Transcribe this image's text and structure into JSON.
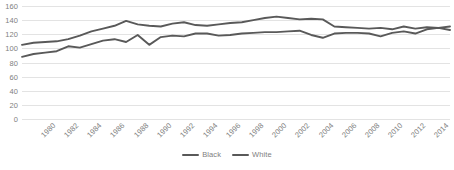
{
  "chart_data": {
    "type": "line",
    "title": "",
    "subtitle": "",
    "xlabel": "",
    "ylabel": "",
    "ylim": [
      0,
      160
    ],
    "ytick_step": 20,
    "yticks": [
      "0",
      "20",
      "40",
      "60",
      "80",
      "100",
      "120",
      "140",
      "160"
    ],
    "grid": true,
    "grid_color": "#e3e3e3",
    "legend_position": "bottom",
    "xtick_labels": [
      "1980",
      "1982",
      "1984",
      "1986",
      "1988",
      "1990",
      "1992",
      "1994",
      "1996",
      "1998",
      "2000",
      "2002",
      "2004",
      "2006",
      "2008",
      "2010",
      "2012",
      "2014",
      "2016"
    ],
    "x": [
      1980,
      1981,
      1982,
      1983,
      1984,
      1985,
      1986,
      1987,
      1988,
      1989,
      1990,
      1991,
      1992,
      1993,
      1994,
      1995,
      1996,
      1997,
      1998,
      1999,
      2000,
      2001,
      2002,
      2003,
      2004,
      2005,
      2006,
      2007,
      2008,
      2009,
      2010,
      2011,
      2012,
      2013,
      2014,
      2015,
      2016,
      2017
    ],
    "series": [
      {
        "name": "Black",
        "color": "#595959",
        "values": [
          105,
          108,
          109,
          110,
          113,
          118,
          124,
          128,
          132,
          139,
          134,
          132,
          131,
          135,
          137,
          133,
          132,
          134,
          136,
          137,
          140,
          143,
          145,
          143,
          141,
          142,
          141,
          131,
          130,
          129,
          128,
          129,
          127,
          131,
          128,
          130,
          129,
          131
        ]
      },
      {
        "name": "White",
        "color": "#595959",
        "values": [
          88,
          92,
          94,
          96,
          103,
          101,
          106,
          111,
          113,
          109,
          119,
          105,
          116,
          118,
          117,
          121,
          121,
          118,
          119,
          121,
          122,
          123,
          123,
          124,
          125,
          119,
          115,
          121,
          122,
          122,
          121,
          117,
          122,
          124,
          121,
          127,
          129,
          126
        ]
      }
    ]
  },
  "legend": {
    "items": [
      {
        "label": "Black"
      },
      {
        "label": "White"
      }
    ]
  }
}
